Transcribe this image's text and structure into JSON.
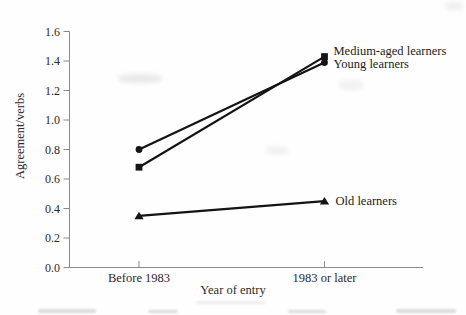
{
  "chart_data": {
    "type": "line",
    "title": "",
    "xlabel": "Year of entry",
    "ylabel": "Agreement/verbs",
    "x_categories": [
      "Before 1983",
      "1983 or later"
    ],
    "series": [
      {
        "name": "Young learners",
        "marker": "circle",
        "values": [
          0.8,
          1.39
        ],
        "label_dx": 9,
        "label_dy": 1.5
      },
      {
        "name": "Medium-aged learners",
        "marker": "square",
        "values": [
          0.68,
          1.43
        ],
        "label_dx": 9,
        "label_dy": -6
      },
      {
        "name": "Old learners",
        "marker": "triangle",
        "values": [
          0.35,
          0.45
        ],
        "label_dx": 11,
        "label_dy": 0
      }
    ],
    "ylim": [
      0.0,
      1.6
    ],
    "ytick_labels": [
      "0.0",
      "0.2",
      "0.4",
      "0.6",
      "0.8",
      "1.0",
      "1.2",
      "1.4",
      "1.6"
    ],
    "grid": false,
    "legend_position": "right-of-line-end",
    "line_color": "#141414",
    "axis_color": "#8a8a8a",
    "text_color": "#2e2a26"
  }
}
